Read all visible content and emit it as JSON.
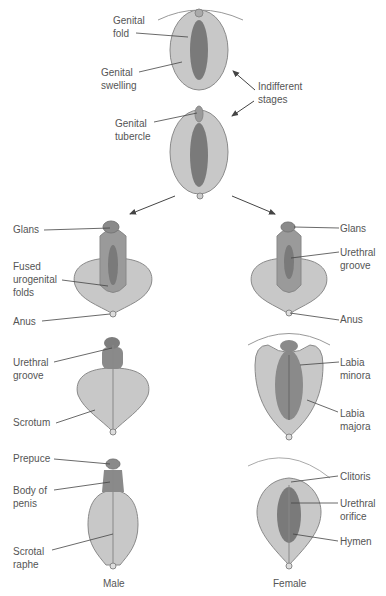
{
  "colors": {
    "outer": "#c8c8c8",
    "inner": "#7a7a7a",
    "mid": "#9a9a9a",
    "outline": "#8a8a8a",
    "leader": "#444444",
    "text": "#555555"
  },
  "indifferent": {
    "stage1": {
      "genital_fold": "Genital\nfold",
      "genital_swelling": "Genital\nswelling"
    },
    "stage2": {
      "genital_tubercle": "Genital\ntubercle"
    },
    "indifferent_stages": "Indifferent\nstages"
  },
  "male": {
    "stage1": {
      "glans": "Glans",
      "fused_folds": "Fused\nurogenital\nfolds",
      "anus": "Anus"
    },
    "stage2": {
      "urethral_groove": "Urethral\ngroove",
      "scrotum": "Scrotum"
    },
    "stage3": {
      "prepuce": "Prepuce",
      "body_of_penis": "Body of\npenis",
      "scrotal_raphe": "Scrotal\nraphe"
    },
    "caption": "Male"
  },
  "female": {
    "stage1": {
      "glans": "Glans",
      "urethral_groove": "Urethral\ngroove",
      "anus": "Anus"
    },
    "stage2": {
      "labia_minora": "Labia\nminora",
      "labia_majora": "Labia\nmajora"
    },
    "stage3": {
      "clitoris": "Clitoris",
      "urethral_orifice": "Urethral\norifice",
      "hymen": "Hymen"
    },
    "caption": "Female"
  }
}
